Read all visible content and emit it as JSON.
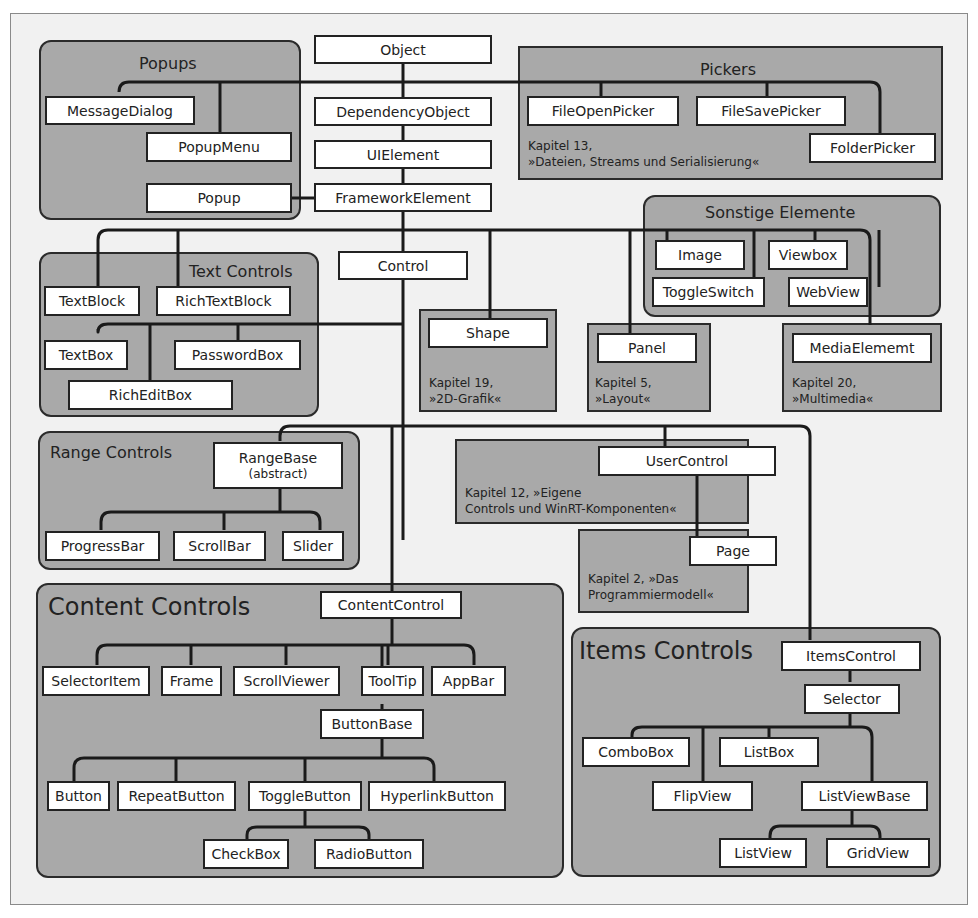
{
  "diagram": {
    "colors": {
      "background": "#f1f1f1",
      "group_fill": "#a9a9a9",
      "box_fill": "#ffffff",
      "line": "#1a1a1a"
    },
    "groups": {
      "popups": {
        "title": "Popups"
      },
      "pickers": {
        "title": "Pickers",
        "note": "Kapitel 13,\n»Dateien, Streams und Serialisierung«"
      },
      "sonstige": {
        "title": "Sonstige Elemente"
      },
      "text_controls": {
        "title": "Text Controls"
      },
      "shape": {
        "note": "Kapitel 19,\n»2D-Grafik«"
      },
      "panel": {
        "note": "Kapitel 5,\n»Layout«"
      },
      "media": {
        "note": "Kapitel 20,\n»Multimedia«"
      },
      "range_controls": {
        "title": "Range Controls"
      },
      "usercontrol": {
        "note": "Kapitel 12, »Eigene\nControls und WinRT-Komponenten«"
      },
      "page": {
        "note": "Kapitel 2, »Das\nProgrammiermodell«"
      },
      "content_controls": {
        "title": "Content Controls"
      },
      "items_controls": {
        "title": "Items Controls"
      }
    },
    "nodes": {
      "object": "Object",
      "dependency_object": "DependencyObject",
      "ui_element": "UIElement",
      "framework_element": "FrameworkElement",
      "message_dialog": "MessageDialog",
      "popup_menu": "PopupMenu",
      "popup": "Popup",
      "file_open_picker": "FileOpenPicker",
      "file_save_picker": "FileSavePicker",
      "folder_picker": "FolderPicker",
      "image": "Image",
      "viewbox": "Viewbox",
      "toggle_switch": "ToggleSwitch",
      "web_view": "WebView",
      "control": "Control",
      "text_block": "TextBlock",
      "rich_text_block": "RichTextBlock",
      "text_box": "TextBox",
      "password_box": "PasswordBox",
      "rich_edit_box": "RichEditBox",
      "shape": "Shape",
      "panel": "Panel",
      "media_element": "MediaElememt",
      "range_base": "RangeBase",
      "range_base_sub": "(abstract)",
      "progress_bar": "ProgressBar",
      "scroll_bar": "ScrollBar",
      "slider": "Slider",
      "user_control": "UserControl",
      "page": "Page",
      "content_control": "ContentControl",
      "selector_item": "SelectorItem",
      "frame": "Frame",
      "scroll_viewer": "ScrollViewer",
      "tool_tip": "ToolTip",
      "app_bar": "AppBar",
      "button_base": "ButtonBase",
      "button": "Button",
      "repeat_button": "RepeatButton",
      "toggle_button": "ToggleButton",
      "hyperlink_button": "HyperlinkButton",
      "check_box": "CheckBox",
      "radio_button": "RadioButton",
      "items_control": "ItemsControl",
      "selector": "Selector",
      "combo_box": "ComboBox",
      "list_box": "ListBox",
      "flip_view": "FlipView",
      "list_view_base": "ListViewBase",
      "list_view": "ListView",
      "grid_view": "GridView"
    }
  }
}
